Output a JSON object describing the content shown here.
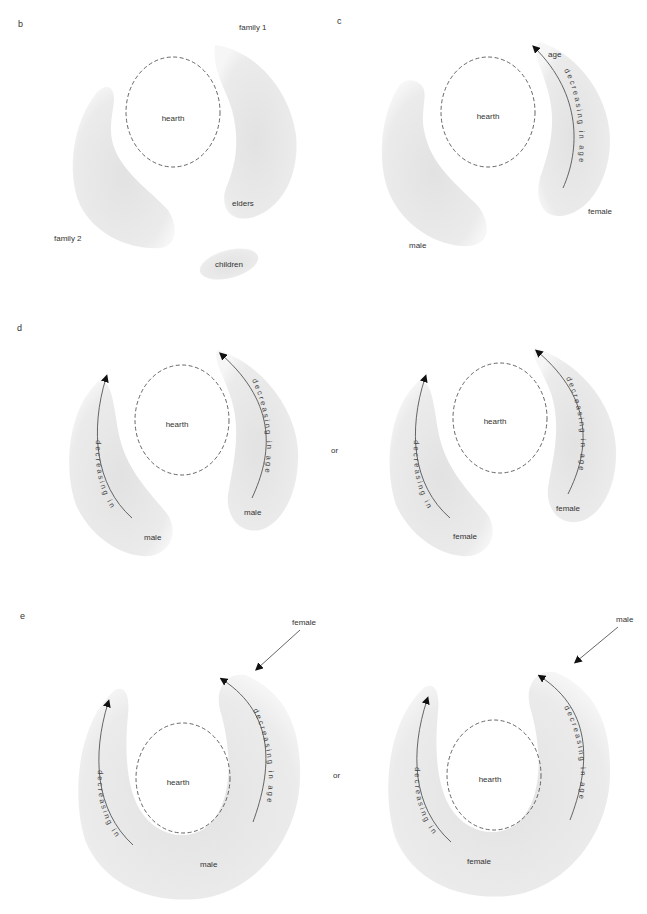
{
  "panels": {
    "b": {
      "label": "b",
      "hearth": "hearth",
      "labels": {
        "family1": "family 1",
        "family2": "family 2",
        "elders": "elders",
        "children": "children"
      }
    },
    "c": {
      "label": "c",
      "hearth": "hearth",
      "labels": {
        "age": "age",
        "arc_text": "decreasing in age",
        "female": "female",
        "male": "male"
      }
    },
    "d": {
      "label": "d",
      "separator": "or",
      "left": {
        "hearth": "hearth",
        "arc_left": "decreasing in age",
        "arc_right": "decreasing in age",
        "group_left": "male",
        "group_right": "male"
      },
      "right": {
        "hearth": "hearth",
        "arc_left": "decreasing in age",
        "arc_right": "decreasing in age",
        "group_left": "female",
        "group_right": "female"
      }
    },
    "e": {
      "label": "e",
      "separator": "or",
      "left": {
        "hearth": "hearth",
        "arc_left": "decreasing in age",
        "arc_right": "decreasing in age",
        "group": "male",
        "incoming": "female"
      },
      "right": {
        "hearth": "hearth",
        "arc_left": "decreasing in age",
        "arc_right": "decreasing in age",
        "group": "female",
        "incoming": "male"
      }
    }
  },
  "colors": {
    "shade": "#e6e6e6",
    "line": "#555555",
    "text": "#333333"
  }
}
